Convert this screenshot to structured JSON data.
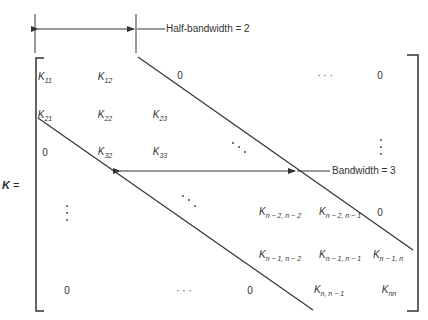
{
  "diagram": {
    "matrix_name": "K",
    "equals": "=",
    "half_bandwidth_label": "Half-bandwidth = 2",
    "bandwidth_label": "Bandwidth = 3",
    "cells": [
      {
        "id": "k11",
        "base": "K",
        "sub": "11",
        "x": 45,
        "y": 77
      },
      {
        "id": "k12",
        "base": "K",
        "sub": "12",
        "x": 105,
        "y": 77
      },
      {
        "id": "r1c3",
        "text": "0",
        "x": 180,
        "y": 75
      },
      {
        "id": "r1dots",
        "text": "· · ·",
        "x": 325,
        "y": 75
      },
      {
        "id": "r1cn",
        "text": "0",
        "x": 380,
        "y": 75
      },
      {
        "id": "k21",
        "base": "K",
        "sub": "21",
        "x": 45,
        "y": 115
      },
      {
        "id": "k22",
        "base": "K",
        "sub": "22",
        "x": 105,
        "y": 115
      },
      {
        "id": "k23",
        "base": "K",
        "sub": "23",
        "x": 160,
        "y": 115
      },
      {
        "id": "r3c1",
        "text": "0",
        "x": 45,
        "y": 152
      },
      {
        "id": "k32",
        "base": "K",
        "sub": "32",
        "x": 105,
        "y": 152
      },
      {
        "id": "k33",
        "base": "K",
        "sub": "33",
        "x": 160,
        "y": 152
      },
      {
        "id": "kn2n2",
        "base": "K",
        "sub": "n − 2, n − 2",
        "x": 280,
        "y": 212
      },
      {
        "id": "kn2n1",
        "base": "K",
        "sub": "n − 2, n − 1",
        "x": 340,
        "y": 212
      },
      {
        "id": "r4cn",
        "text": "0",
        "x": 380,
        "y": 212
      },
      {
        "id": "kn1n2",
        "base": "K",
        "sub": "n − 1, n − 2",
        "x": 280,
        "y": 255
      },
      {
        "id": "kn1n1",
        "base": "K",
        "sub": "n − 1, n − 1",
        "x": 340,
        "y": 255
      },
      {
        "id": "kn1n",
        "base": "K",
        "sub": "n − 1, n",
        "x": 388,
        "y": 255
      },
      {
        "id": "rnc1",
        "text": "0",
        "x": 67,
        "y": 290
      },
      {
        "id": "rndots",
        "text": "· · ·",
        "x": 184,
        "y": 290
      },
      {
        "id": "rnc3",
        "text": "0",
        "x": 250,
        "y": 290
      },
      {
        "id": "knn1",
        "base": "K",
        "sub": "n, n − 1",
        "x": 329,
        "y": 290
      },
      {
        "id": "knn",
        "base": "K",
        "sub": "nn",
        "x": 389,
        "y": 290
      }
    ]
  }
}
